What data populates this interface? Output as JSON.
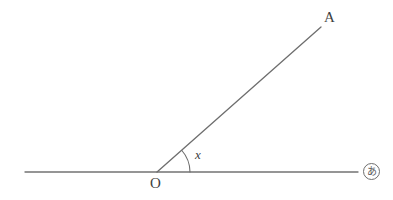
{
  "figure": {
    "type": "geometry-diagram",
    "background_color": "#ffffff",
    "stroke_color": "#707070",
    "text_color": "#3f3f3f",
    "labels": {
      "point_a": "A",
      "vertex_o": "O",
      "angle_x": "x",
      "question_marker": "あ"
    },
    "geometry": {
      "horizontal_line": {
        "x1": 25,
        "y1": 172,
        "x2": 358,
        "y2": 172
      },
      "ray_oa": {
        "x1": 157,
        "y1": 172,
        "x2": 321,
        "y2": 27
      },
      "vertex": {
        "x": 157,
        "y": 172
      },
      "angle_arc": {
        "center_x": 157,
        "center_y": 172,
        "radius": 33,
        "start_angle_deg": 0,
        "end_angle_deg": 41
      },
      "angle_value_deg": 41
    }
  }
}
